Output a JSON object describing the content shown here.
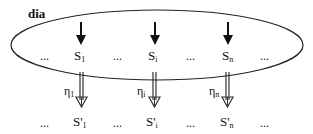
{
  "diagram": {
    "title": "dia",
    "top_row": {
      "nodes": [
        {
          "base": "S",
          "sub": "1"
        },
        {
          "base": "S",
          "sub": "i"
        },
        {
          "base": "S",
          "sub": "n"
        }
      ],
      "ellipsis": "..."
    },
    "bottom_row": {
      "nodes": [
        {
          "base": "S'",
          "sub": "1"
        },
        {
          "base": "S'",
          "sub": "i"
        },
        {
          "base": "S'",
          "sub": "n"
        }
      ],
      "ellipsis": "..."
    },
    "transitions": [
      {
        "base": "η",
        "sub": "1"
      },
      {
        "base": "η",
        "sub": "i"
      },
      {
        "base": "η",
        "sub": "n"
      }
    ]
  }
}
